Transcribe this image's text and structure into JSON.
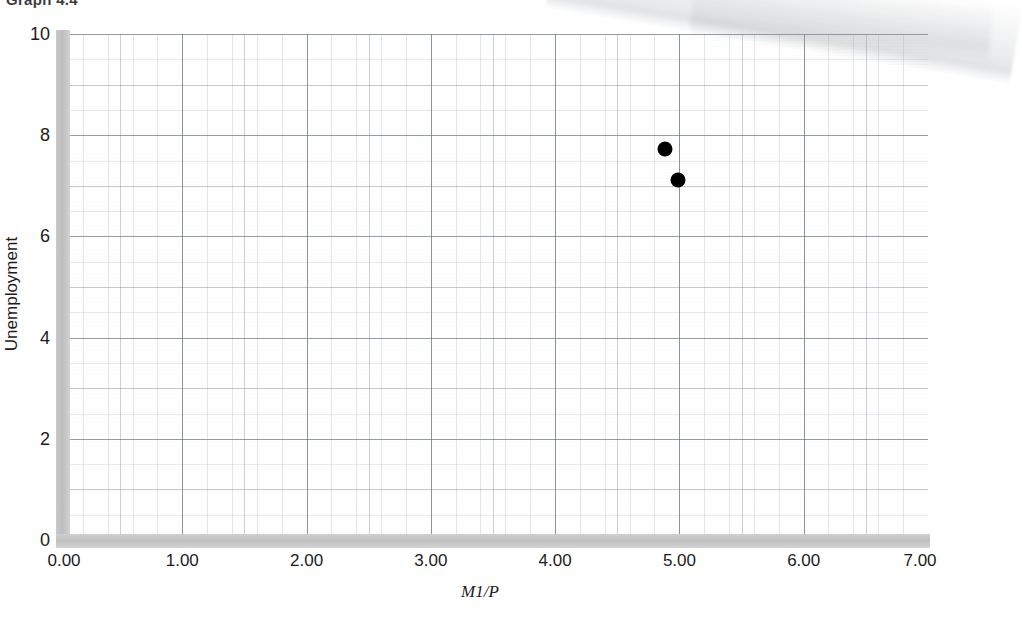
{
  "caption": "Graph 4.4",
  "chart_data": {
    "type": "scatter",
    "title": "",
    "xlabel": "M1/P",
    "ylabel": "Unemployment",
    "xlim": [
      0,
      7
    ],
    "ylim": [
      0,
      10
    ],
    "grid": true,
    "legend": "none",
    "xticks": [
      "0.00",
      "1.00",
      "2.00",
      "3.00",
      "4.00",
      "5.00",
      "6.00",
      "7.00"
    ],
    "xtick_values": [
      0,
      1,
      2,
      3,
      4,
      5,
      6,
      7
    ],
    "yticks": [
      "0",
      "2",
      "4",
      "6",
      "8",
      "10"
    ],
    "ytick_values": [
      0,
      2,
      4,
      6,
      8,
      10
    ],
    "series": [
      {
        "name": "observations",
        "marker": "filled-circle",
        "color": "#000000",
        "points": [
          {
            "x": 4.88,
            "y": 7.73
          },
          {
            "x": 4.99,
            "y": 7.11
          }
        ]
      }
    ]
  },
  "colors": {
    "axis_bar": "#c4c4c4",
    "grid_major": "#707884",
    "grid_minor": "#969ea8",
    "marker": "#000000",
    "text": "#1c1c1c",
    "background": "#ffffff"
  }
}
